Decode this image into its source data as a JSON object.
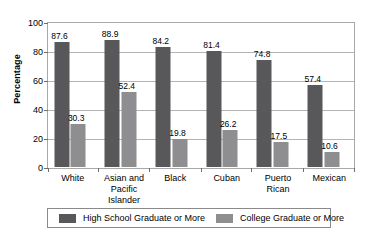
{
  "chart_data": {
    "type": "bar",
    "title": "",
    "xlabel": "",
    "ylabel": "Percentage",
    "ylim": [
      0,
      100
    ],
    "yticks": [
      0,
      20,
      40,
      60,
      80,
      100
    ],
    "grid": true,
    "legend_position": "bottom",
    "categories": [
      "White",
      "Asian and Pacific Islander",
      "Black",
      "Cuban",
      "Puerto Rican",
      "Mexican"
    ],
    "category_lines": [
      [
        "White"
      ],
      [
        "Asian and",
        "Pacific",
        "Islander"
      ],
      [
        "Black"
      ],
      [
        "Cuban"
      ],
      [
        "Puerto",
        "Rican"
      ],
      [
        "Mexican"
      ]
    ],
    "series": [
      {
        "name": "High School Graduate or More",
        "color": "#58585a",
        "values": [
          87.6,
          88.9,
          84.2,
          81.4,
          74.8,
          57.4
        ]
      },
      {
        "name": "College Graduate or More",
        "color": "#8e8e90",
        "values": [
          30.3,
          52.4,
          19.8,
          26.2,
          17.5,
          10.6
        ]
      }
    ]
  },
  "colors": {
    "series_high_school": "#58585a",
    "series_college": "#8e8e90",
    "gridline": "#b4b4b4",
    "axis": "#a8a8a8",
    "text": "#000000",
    "background": "#ffffff"
  }
}
